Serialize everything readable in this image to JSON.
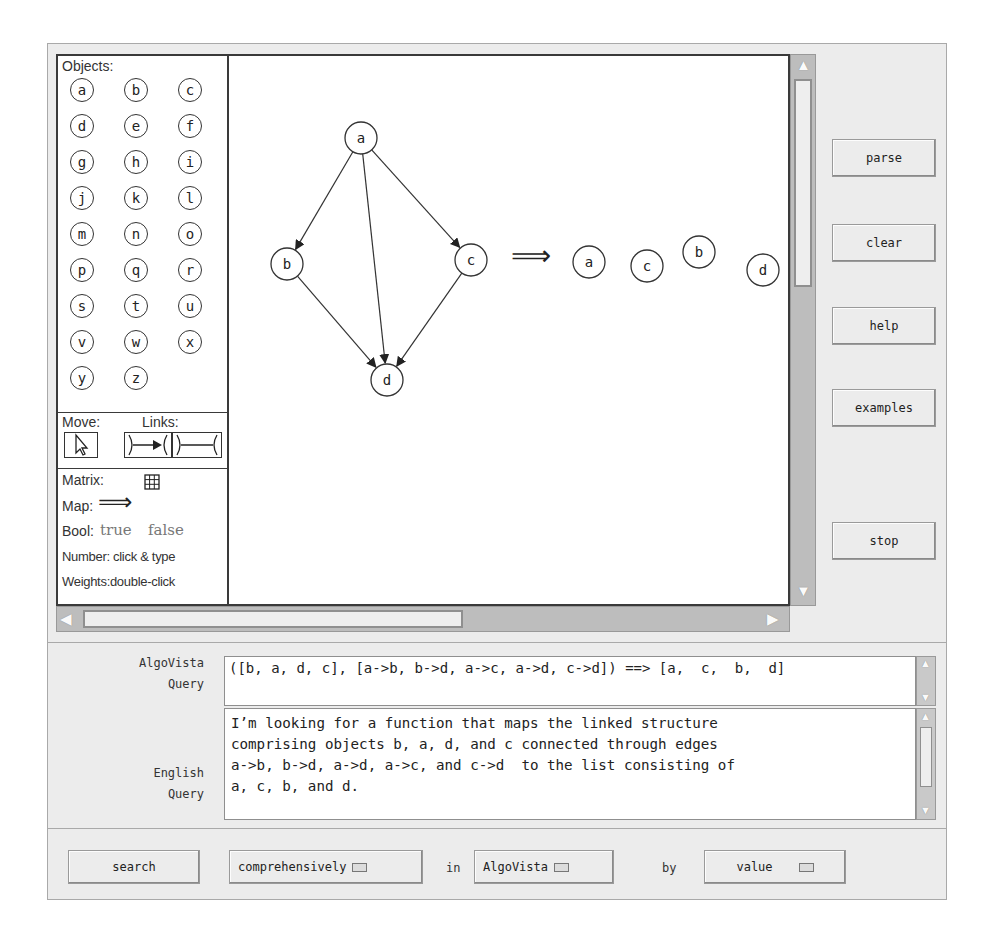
{
  "palette": {
    "objects_label": "Objects:",
    "objects": [
      "a",
      "b",
      "c",
      "d",
      "e",
      "f",
      "g",
      "h",
      "i",
      "j",
      "k",
      "l",
      "m",
      "n",
      "o",
      "p",
      "q",
      "r",
      "s",
      "t",
      "u",
      "v",
      "w",
      "x",
      "y",
      "z"
    ],
    "move_label": "Move:",
    "links_label": "Links:",
    "matrix_label": "Matrix:",
    "map_label": "Map:",
    "map_symbol": "⟹",
    "bool_label": "Bool:",
    "bool_true": "true",
    "bool_false": "false",
    "number_label": "Number: click & type",
    "weights_label": "Weights:double-click"
  },
  "canvas": {
    "graph_nodes": [
      {
        "id": "a",
        "x": 132,
        "y": 82
      },
      {
        "id": "b",
        "x": 58,
        "y": 208
      },
      {
        "id": "c",
        "x": 242,
        "y": 204
      },
      {
        "id": "d",
        "x": 158,
        "y": 324
      }
    ],
    "graph_edges": [
      [
        "a",
        "b"
      ],
      [
        "a",
        "d"
      ],
      [
        "a",
        "c"
      ],
      [
        "b",
        "d"
      ],
      [
        "c",
        "d"
      ]
    ],
    "map_arrow": "⟹",
    "result_nodes": [
      {
        "id": "a",
        "x": 360,
        "y": 206
      },
      {
        "id": "c",
        "x": 418,
        "y": 210
      },
      {
        "id": "b",
        "x": 470,
        "y": 196
      },
      {
        "id": "d",
        "x": 534,
        "y": 214
      }
    ]
  },
  "side_buttons": {
    "parse": "parse",
    "clear": "clear",
    "help": "help",
    "examples": "examples",
    "stop": "stop"
  },
  "query": {
    "algovista_label_1": "AlgoVista",
    "algovista_label_2": "Query",
    "algovista_value": "([b, a, d, c], [a->b, b->d, a->c, a->d, c->d]) ==> [a,  c,  b,  d]",
    "english_label_1": "English",
    "english_label_2": "Query",
    "english_lines": [
      "I’m looking for a function that maps the linked structure",
      "comprising objects b, a, d, and c connected through edges",
      "a->b, b->d, a->d, a->c, and c->d  to the list consisting of",
      "a, c, b, and d."
    ]
  },
  "bottom_bar": {
    "search_button": "search",
    "mode_select": "comprehensively",
    "in_label": "in",
    "source_select": "AlgoVista",
    "by_label": "by",
    "by_select": "value"
  }
}
